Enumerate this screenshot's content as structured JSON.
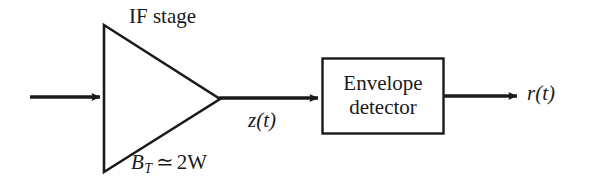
{
  "figure": {
    "background_color": "#ffffff",
    "stroke_color": "#1a1a1a",
    "width": 589,
    "height": 183
  },
  "labels": {
    "if_stage": "IF stage",
    "bandwidth": {
      "symbol": "B",
      "subscript": "T",
      "relation": "≃",
      "value": "2W",
      "full": "B_T ≃ 2W"
    },
    "intermediate_signal": "z(t)",
    "output_signal": "r(t)"
  },
  "blocks": {
    "amplifier": {
      "name": "IF stage",
      "shape": "triangle"
    },
    "envelope_detector": {
      "line1": "Envelope",
      "line2": "detector",
      "shape": "rectangle"
    }
  },
  "signals": {
    "input_arrow": "input-signal",
    "if_to_detector_arrow": "z(t)",
    "output_arrow": "r(t)"
  }
}
